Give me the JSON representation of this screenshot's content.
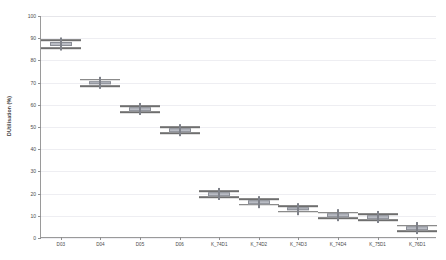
{
  "chart_data": {
    "type": "box",
    "title": "",
    "xlabel": "",
    "ylabel": "DUtilisation (%)",
    "ylim": [
      0,
      100
    ],
    "yticks": [
      0,
      10,
      20,
      30,
      40,
      50,
      60,
      70,
      80,
      90,
      100
    ],
    "grid": true,
    "legend": "none",
    "categories": [
      "D03",
      "D04",
      "D05",
      "D06",
      "K_74D1",
      "K_74D2",
      "K_74D3",
      "K_74D4",
      "K_75D1",
      "K_76D1"
    ],
    "boxes": [
      {
        "category": "D03",
        "whisker_low": 85.5,
        "q1": 86.4,
        "median": 87.3,
        "q3": 88.2,
        "whisker_high": 89.0
      },
      {
        "category": "D04",
        "whisker_low": 68.3,
        "q1": 69.1,
        "median": 69.8,
        "q3": 70.6,
        "whisker_high": 71.3
      },
      {
        "category": "D05",
        "whisker_low": 56.6,
        "q1": 57.3,
        "median": 58.0,
        "q3": 58.7,
        "whisker_high": 59.4
      },
      {
        "category": "D06",
        "whisker_low": 47.2,
        "q1": 47.9,
        "median": 48.5,
        "q3": 49.1,
        "whisker_high": 49.8
      },
      {
        "category": "K_74D1",
        "whisker_low": 18.3,
        "q1": 19.0,
        "median": 19.7,
        "q3": 20.4,
        "whisker_high": 21.1
      },
      {
        "category": "K_74D2",
        "whisker_low": 15.0,
        "q1": 15.6,
        "median": 16.2,
        "q3": 16.8,
        "whisker_high": 17.4
      },
      {
        "category": "K_74D3",
        "whisker_low": 11.9,
        "q1": 12.5,
        "median": 13.1,
        "q3": 13.7,
        "whisker_high": 14.3
      },
      {
        "category": "K_74D4",
        "whisker_low": 9.0,
        "q1": 9.6,
        "median": 10.2,
        "q3": 10.8,
        "whisker_high": 11.4
      },
      {
        "category": "K_75D1",
        "whisker_low": 7.9,
        "q1": 8.6,
        "median": 9.3,
        "q3": 10.0,
        "whisker_high": 10.7
      },
      {
        "category": "K_76D1",
        "whisker_low": 3.0,
        "q1": 3.7,
        "median": 4.3,
        "q3": 5.0,
        "whisker_high": 5.6
      }
    ],
    "colors": {
      "box_fill": "#b9bcc4",
      "box_edge": "#8a8d95",
      "whisker": "#6e6e6e",
      "median": "#7e8189",
      "axis": "#9a9a9a",
      "grid": "#eeeef2",
      "text": "#4a4a4a",
      "background": "#ffffff"
    }
  }
}
